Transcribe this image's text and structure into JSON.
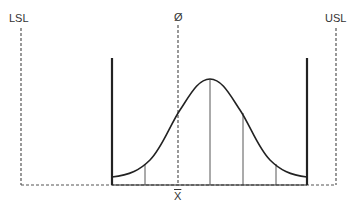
{
  "labels": {
    "lsl": "LSL",
    "usl": "USL",
    "target": "Ø",
    "mean": "X"
  },
  "colors": {
    "line": "#222222",
    "dashed": "#555555",
    "text": "#333333"
  },
  "diagram": {
    "type": "normal-distribution-with-spec-limits",
    "segment_lines": 5
  }
}
